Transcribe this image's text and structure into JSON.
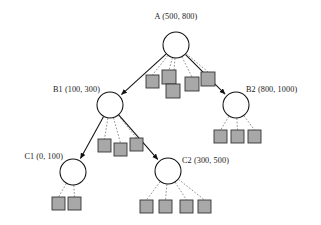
{
  "diagram": {
    "colors": {
      "background": "#ffffff",
      "node_stroke": "#111111",
      "node_fill": "#ffffff",
      "leaf_fill": "#a8a8a8",
      "leaf_stroke": "#333333",
      "solid_edge": "#111111",
      "dashed_edge": "#6f6f6f",
      "text": "#1a1a1a"
    },
    "nodes": [
      {
        "id": "A",
        "label": "A (500, 800)",
        "name": "root",
        "cx": 176,
        "cy": 45,
        "r": 13,
        "label_x": 176,
        "label_y": 19,
        "label_anchor": "middle"
      },
      {
        "id": "B1",
        "label": "B1 (100, 300)",
        "name": "branch-left",
        "cx": 110,
        "cy": 105,
        "r": 13,
        "label_x": 100,
        "label_y": 92,
        "label_anchor": "end"
      },
      {
        "id": "B2",
        "label": "B2 (800, 1000)",
        "name": "branch-right",
        "cx": 236,
        "cy": 105,
        "r": 13,
        "label_x": 246,
        "label_y": 92,
        "label_anchor": "start"
      },
      {
        "id": "C1",
        "label": "C1 (0, 100)",
        "name": "leaf-branch-left",
        "cx": 73,
        "cy": 172,
        "r": 13,
        "label_x": 63,
        "label_y": 159,
        "label_anchor": "end"
      },
      {
        "id": "C2",
        "label": "C2 (300, 500)",
        "name": "leaf-branch-right",
        "cx": 168,
        "cy": 171,
        "r": 13,
        "label_x": 182,
        "label_y": 163,
        "label_anchor": "start"
      }
    ],
    "solid_edges": [
      {
        "from": "A",
        "to": "B1"
      },
      {
        "from": "A",
        "to": "B2"
      },
      {
        "from": "B1",
        "to": "C1"
      },
      {
        "from": "B1",
        "to": "C2"
      }
    ],
    "leaf_groups": [
      {
        "parent": "A",
        "count": 5,
        "squares": [
          {
            "x": 146,
            "y": 75,
            "w": 13,
            "h": 13
          },
          {
            "x": 162,
            "y": 70,
            "w": 14,
            "h": 14
          },
          {
            "x": 166,
            "y": 84,
            "w": 14,
            "h": 14
          },
          {
            "x": 185,
            "y": 77,
            "w": 14,
            "h": 14
          },
          {
            "x": 201,
            "y": 72,
            "w": 14,
            "h": 14
          }
        ]
      },
      {
        "parent": "B1",
        "count": 3,
        "squares": [
          {
            "x": 98,
            "y": 139,
            "w": 13,
            "h": 13
          },
          {
            "x": 114,
            "y": 143,
            "w": 13,
            "h": 13
          },
          {
            "x": 130,
            "y": 138,
            "w": 13,
            "h": 13
          }
        ]
      },
      {
        "parent": "B2",
        "count": 3,
        "squares": [
          {
            "x": 214,
            "y": 130,
            "w": 13,
            "h": 13
          },
          {
            "x": 231,
            "y": 130,
            "w": 13,
            "h": 13
          },
          {
            "x": 248,
            "y": 130,
            "w": 13,
            "h": 13
          }
        ]
      },
      {
        "parent": "C1",
        "count": 2,
        "squares": [
          {
            "x": 52,
            "y": 197,
            "w": 13,
            "h": 13
          },
          {
            "x": 68,
            "y": 197,
            "w": 13,
            "h": 13
          }
        ]
      },
      {
        "parent": "C2",
        "count": 4,
        "squares": [
          {
            "x": 140,
            "y": 200,
            "w": 13,
            "h": 13
          },
          {
            "x": 159,
            "y": 200,
            "w": 13,
            "h": 13
          },
          {
            "x": 180,
            "y": 200,
            "w": 13,
            "h": 13
          },
          {
            "x": 198,
            "y": 200,
            "w": 13,
            "h": 13
          }
        ]
      }
    ]
  }
}
